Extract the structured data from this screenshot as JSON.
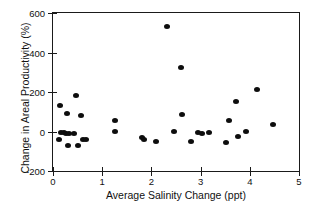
{
  "chart_data": {
    "type": "scatter",
    "title": "",
    "xlabel": "Average Salinity Change (ppt)",
    "ylabel": "Change in Areal Productivity (%)",
    "xlim": [
      0,
      5
    ],
    "ylim": [
      -200,
      600
    ],
    "xticks": [
      0,
      1,
      2,
      3,
      4,
      5
    ],
    "yticks": [
      -200,
      0,
      200,
      400,
      600
    ],
    "xtick_labels": [
      "0",
      "1",
      "2",
      "3",
      "4",
      "5"
    ],
    "ytick_labels": [
      "-200",
      "0",
      "200",
      "400",
      "600"
    ],
    "grid": false,
    "legend": null,
    "marker": {
      "shape": "circle",
      "color": "#0d0d0d",
      "size_px": 6
    },
    "points": [
      {
        "x": 0.12,
        "y": -40
      },
      {
        "x": 0.14,
        "y": 130
      },
      {
        "x": 0.16,
        "y": -5
      },
      {
        "x": 0.22,
        "y": -5
      },
      {
        "x": 0.26,
        "y": -8
      },
      {
        "x": 0.28,
        "y": 90
      },
      {
        "x": 0.3,
        "y": -70
      },
      {
        "x": 0.33,
        "y": -8
      },
      {
        "x": 0.42,
        "y": -8
      },
      {
        "x": 0.46,
        "y": 180
      },
      {
        "x": 0.5,
        "y": -70
      },
      {
        "x": 0.56,
        "y": 80
      },
      {
        "x": 0.6,
        "y": -40
      },
      {
        "x": 0.68,
        "y": -40
      },
      {
        "x": 1.25,
        "y": 55
      },
      {
        "x": 1.26,
        "y": 0
      },
      {
        "x": 1.8,
        "y": -30
      },
      {
        "x": 1.84,
        "y": -38
      },
      {
        "x": 2.1,
        "y": -50
      },
      {
        "x": 2.32,
        "y": 530
      },
      {
        "x": 2.45,
        "y": 0
      },
      {
        "x": 2.6,
        "y": 325
      },
      {
        "x": 2.62,
        "y": 85
      },
      {
        "x": 2.8,
        "y": -50
      },
      {
        "x": 2.95,
        "y": -5
      },
      {
        "x": 3.02,
        "y": -8
      },
      {
        "x": 3.18,
        "y": -5
      },
      {
        "x": 3.52,
        "y": -55
      },
      {
        "x": 3.58,
        "y": 58
      },
      {
        "x": 3.72,
        "y": 150
      },
      {
        "x": 3.76,
        "y": -25
      },
      {
        "x": 3.92,
        "y": -2
      },
      {
        "x": 4.15,
        "y": 215
      },
      {
        "x": 4.48,
        "y": 35
      }
    ]
  }
}
